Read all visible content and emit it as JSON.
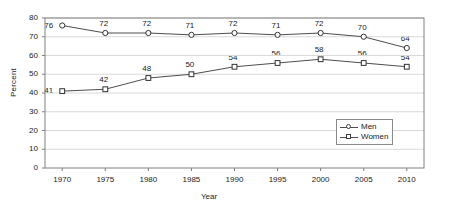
{
  "chart_data": {
    "type": "line",
    "title": "",
    "subtitle": "",
    "xlabel": "Year",
    "ylabel": "Percent",
    "categories": [
      "1970",
      "1975",
      "1980",
      "1985",
      "1990",
      "1995",
      "2000",
      "2005",
      "2010"
    ],
    "x": [
      1970,
      1975,
      1980,
      1985,
      1990,
      1995,
      2000,
      2005,
      2010
    ],
    "xlim": [
      1968,
      2012
    ],
    "ylim": [
      0,
      80
    ],
    "yticks": [
      "0",
      "10",
      "20",
      "30",
      "40",
      "50",
      "60",
      "70",
      "80"
    ],
    "ytick_values": [
      0,
      10,
      20,
      30,
      40,
      50,
      60,
      70,
      80
    ],
    "grid": true,
    "grid_axis": "y",
    "legend_position": "inside-lower-right",
    "series": [
      {
        "name": "Men",
        "marker": "circle",
        "values": [
          76,
          72,
          72,
          71,
          72,
          71,
          72,
          70,
          64
        ],
        "labels": [
          "76",
          "72",
          "72",
          "71",
          "72",
          "71",
          "72",
          "70",
          "64"
        ]
      },
      {
        "name": "Women",
        "marker": "square",
        "values": [
          41,
          42,
          48,
          50,
          54,
          56,
          58,
          56,
          54
        ],
        "labels": [
          "41",
          "42",
          "48",
          "50",
          "54",
          "56",
          "58",
          "56",
          "54"
        ]
      }
    ],
    "colors": {
      "line": "#4d4d4d",
      "marker_fill": "#ffffff",
      "marker_stroke": "#333333",
      "grid": "#d9d9d9",
      "axis": "#808080",
      "text": "#1a1a1a",
      "background": "#ffffff"
    }
  },
  "legend": {
    "entries": [
      {
        "label": "Men"
      },
      {
        "label": "Women"
      }
    ]
  }
}
